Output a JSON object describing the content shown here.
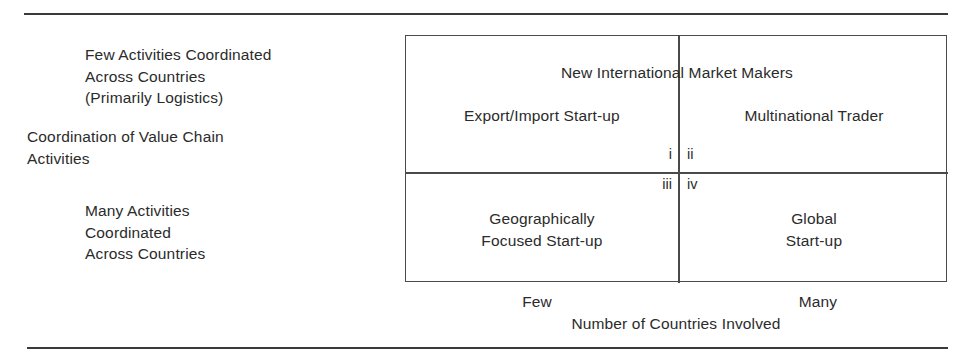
{
  "figure": {
    "y_axis": {
      "title": "Coordination of Value Chain\nActivities",
      "high_label": "Few Activities Coordinated\nAcross Countries\n(Primarily Logistics)",
      "low_label": "Many Activities\nCoordinated\nAcross Countries"
    },
    "x_axis": {
      "title": "Number of Countries Involved",
      "tick_low": "Few",
      "tick_high": "Many"
    },
    "matrix": {
      "banner": "New International Market Makers",
      "cells": [
        {
          "numeral": "i",
          "label": "Export/Import Start-up"
        },
        {
          "numeral": "ii",
          "label": "Multinational Trader"
        },
        {
          "numeral": "iii",
          "label": "Geographically\nFocused Start-up"
        },
        {
          "numeral": "iv",
          "label": "Global\nStart-up"
        }
      ]
    },
    "colors": {
      "line": "#4a4a4a",
      "rule": "#3a3a3a",
      "text": "#2b2b2b",
      "background": "#ffffff"
    }
  }
}
